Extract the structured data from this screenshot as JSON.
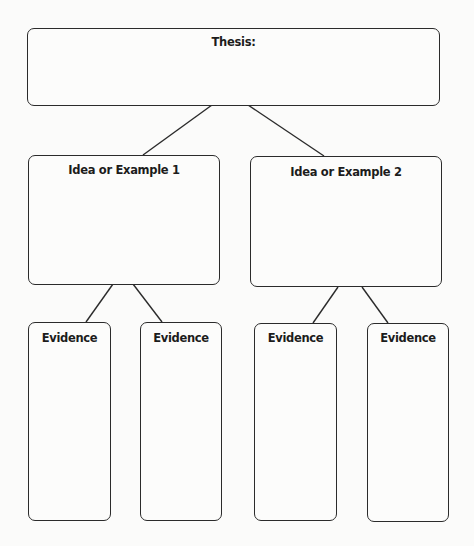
{
  "diagram": {
    "type": "tree graphic organizer",
    "thesis": {
      "label": "Thesis:"
    },
    "ideas": [
      {
        "label": "Idea or Example 1",
        "evidence": [
          {
            "label": "Evidence"
          },
          {
            "label": "Evidence"
          }
        ]
      },
      {
        "label": "Idea or Example 2",
        "evidence": [
          {
            "label": "Evidence"
          },
          {
            "label": "Evidence"
          }
        ]
      }
    ],
    "colors": {
      "stroke": "#2b2b2b",
      "text": "#1c1c1c",
      "background": "#fbfbfa"
    }
  }
}
